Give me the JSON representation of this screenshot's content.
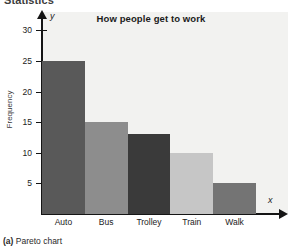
{
  "header_fragment": "Statistics",
  "caption": {
    "label": "(a)",
    "text": " Pareto chart"
  },
  "axis": {
    "y_symbol": "y",
    "x_symbol": "x",
    "y_title": "Frequency"
  },
  "chart_data": {
    "type": "bar",
    "title": "How people get to work",
    "xlabel": "",
    "ylabel": "Frequency",
    "categories": [
      "Auto",
      "Bus",
      "Trolley",
      "Train",
      "Walk"
    ],
    "values": [
      25,
      15,
      13,
      10,
      5
    ],
    "colors": [
      "#595959",
      "#8d8d8d",
      "#3a3a3a",
      "#c6c6c6",
      "#747474"
    ],
    "ylim": [
      0,
      32
    ],
    "yticks": [
      5,
      10,
      15,
      20,
      25,
      30
    ],
    "ytick_labels": [
      "5",
      "10",
      "15",
      "20",
      "25",
      "30"
    ],
    "grid": false,
    "legend": "none",
    "plot_background": "#f2f2f0"
  }
}
